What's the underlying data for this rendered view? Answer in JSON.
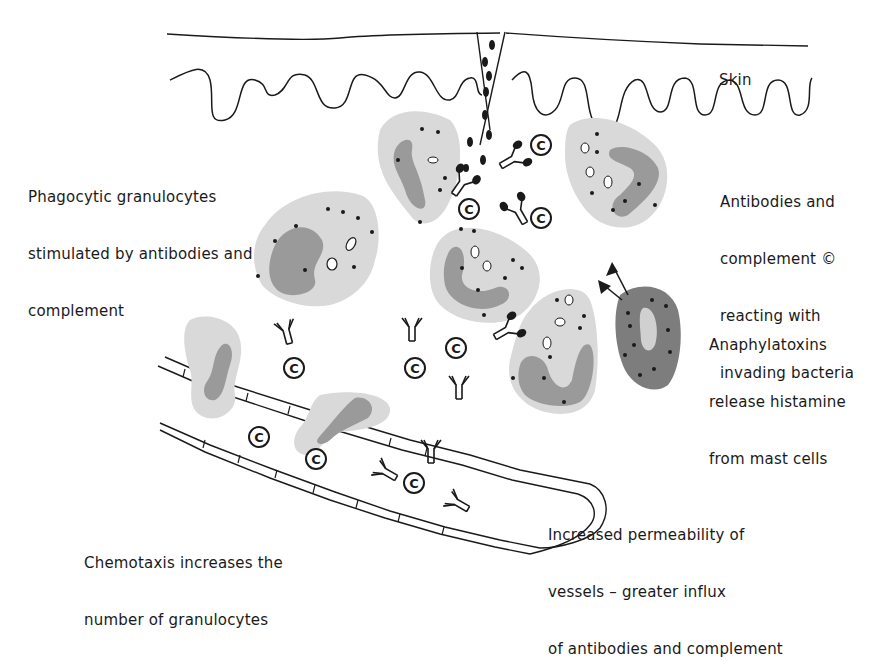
{
  "diagram": {
    "colors": {
      "line": "#1a1a1a",
      "cell_body": "#d9d9d9",
      "nucleus": "#9a9a9a",
      "mast_cell": "#7d7d7d",
      "background": "#ffffff"
    },
    "labels": {
      "skin": "Skin",
      "phagocytic": [
        "Phagocytic granulocytes",
        "stimulated by antibodies and",
        "complement"
      ],
      "antibodies": [
        "Antibodies and",
        "complement ©",
        "reacting with",
        "invading bacteria"
      ],
      "anaphylatoxins": [
        "Anaphylatoxins",
        "release histamine",
        "from mast cells"
      ],
      "permeability": [
        "Increased permeability of",
        "vessels – greater influx",
        "of antibodies and complement"
      ],
      "chemotaxis": [
        "Chemotaxis increases the",
        "number of granulocytes"
      ]
    },
    "symbols": {
      "complement": "C",
      "complement_icon": "circled-c-icon",
      "antibody_icon": "y-shaped-antibody-icon",
      "bacteria_icon": "bacteria-dot-icon",
      "arrow_icon": "arrow-icon"
    },
    "components": [
      "skin-surface",
      "skin-wound",
      "bacteria",
      "granulocyte",
      "mast-cell",
      "antibody",
      "complement",
      "blood-vessel"
    ]
  }
}
